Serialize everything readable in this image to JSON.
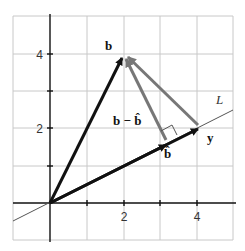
{
  "diagram": {
    "axes": {
      "x_ticks": [
        "2",
        "4"
      ],
      "y_ticks": [
        "2",
        "4"
      ]
    },
    "labels": {
      "b": "b",
      "y": "y",
      "b_hat": "b̂",
      "b_minus_b_hat": "b − b̂",
      "L": "L"
    },
    "vectors": [
      {
        "name": "b",
        "from": [
          0,
          0
        ],
        "to": [
          2,
          4
        ],
        "color": "#111111"
      },
      {
        "name": "y",
        "from": [
          0,
          0
        ],
        "to": [
          4,
          2
        ],
        "color": "#111111"
      },
      {
        "name": "b_hat",
        "from": [
          0,
          0
        ],
        "to": [
          3.2,
          1.6
        ],
        "color": "#111111"
      },
      {
        "name": "b_minus_b_hat",
        "from": [
          3.2,
          1.6
        ],
        "to": [
          2,
          4
        ],
        "color": "#777777"
      },
      {
        "name": "b_minus_y",
        "from": [
          4,
          2
        ],
        "to": [
          2,
          4
        ],
        "color": "#777777"
      }
    ],
    "colors": {
      "grid": "#c8c8c8",
      "axis": "#111111",
      "vector_dark": "#111111",
      "vector_gray": "#777777"
    }
  }
}
